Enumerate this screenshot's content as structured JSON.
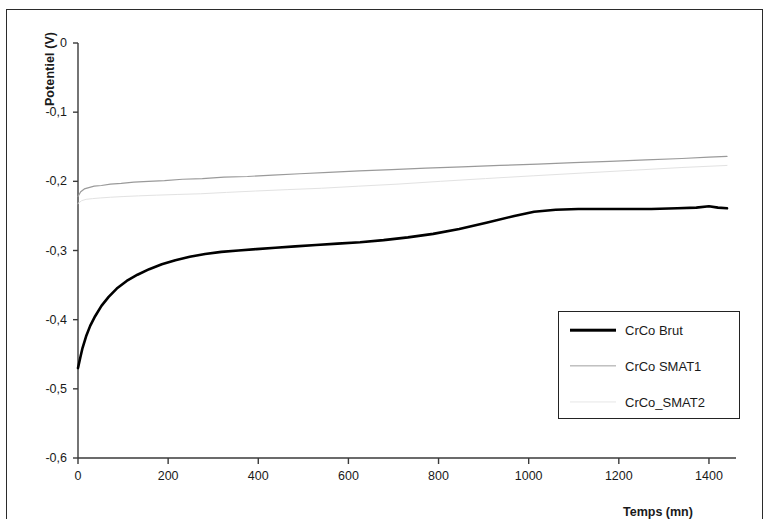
{
  "chart_data": {
    "type": "line",
    "title": "",
    "xlabel": "Temps (mn)",
    "ylabel": "Potentiel (V)",
    "xlim": [
      0,
      1460
    ],
    "ylim": [
      -0.6,
      0
    ],
    "xticks": [
      "0",
      "200",
      "400",
      "600",
      "800",
      "1000",
      "1200",
      "1400"
    ],
    "xtick_values": [
      0,
      200,
      400,
      600,
      800,
      1000,
      1200,
      1400
    ],
    "yticks": [
      "0",
      "-0,1",
      "-0,2",
      "-0,3",
      "-0,4",
      "-0,5",
      "-0,6"
    ],
    "ytick_values": [
      0,
      -0.1,
      -0.2,
      -0.3,
      -0.4,
      -0.5,
      -0.6
    ],
    "grid": false,
    "legend_position": "center-right",
    "decimal_separator": ",",
    "series": [
      {
        "name": "CrCo Brut",
        "color": "#000000",
        "width": 2.6,
        "x": [
          0,
          5,
          10,
          18,
          27,
          38,
          52,
          68,
          86,
          108,
          132,
          158,
          186,
          216,
          248,
          282,
          318,
          356,
          396,
          438,
          482,
          528,
          576,
          626,
          678,
          732,
          788,
          846,
          906,
          968,
          1012,
          1060,
          1110,
          1162,
          1216,
          1272,
          1330,
          1372,
          1400,
          1420,
          1440
        ],
        "y": [
          -0.47,
          -0.455,
          -0.441,
          -0.424,
          -0.409,
          -0.395,
          -0.38,
          -0.367,
          -0.355,
          -0.344,
          -0.335,
          -0.327,
          -0.32,
          -0.314,
          -0.309,
          -0.305,
          -0.302,
          -0.3,
          -0.298,
          -0.296,
          -0.294,
          -0.292,
          -0.29,
          -0.288,
          -0.285,
          -0.281,
          -0.276,
          -0.269,
          -0.26,
          -0.25,
          -0.244,
          -0.241,
          -0.24,
          -0.24,
          -0.24,
          -0.24,
          -0.239,
          -0.238,
          -0.236,
          -0.238,
          -0.239
        ]
      },
      {
        "name": "CrCo SMAT1",
        "color": "#9a9a9a",
        "width": 1.2,
        "x": [
          0,
          6,
          14,
          24,
          36,
          52,
          72,
          96,
          124,
          156,
          192,
          232,
          276,
          324,
          376,
          432,
          492,
          556,
          624,
          696,
          772,
          852,
          936,
          1020,
          1100,
          1180,
          1260,
          1340,
          1400,
          1440
        ],
        "y": [
          -0.222,
          -0.215,
          -0.211,
          -0.209,
          -0.207,
          -0.206,
          -0.204,
          -0.203,
          -0.201,
          -0.2,
          -0.199,
          -0.197,
          -0.196,
          -0.194,
          -0.193,
          -0.191,
          -0.189,
          -0.187,
          -0.185,
          -0.183,
          -0.181,
          -0.179,
          -0.177,
          -0.175,
          -0.173,
          -0.171,
          -0.169,
          -0.167,
          -0.165,
          -0.164
        ]
      },
      {
        "name": "CrCo_SMAT2",
        "color": "#e2e2e2",
        "width": 1.0,
        "x": [
          0,
          8,
          18,
          32,
          50,
          72,
          100,
          134,
          174,
          220,
          272,
          330,
          394,
          464,
          540,
          622,
          710,
          804,
          904,
          1010,
          1120,
          1230,
          1340,
          1440
        ],
        "y": [
          -0.232,
          -0.228,
          -0.226,
          -0.225,
          -0.224,
          -0.223,
          -0.222,
          -0.221,
          -0.22,
          -0.219,
          -0.218,
          -0.216,
          -0.214,
          -0.212,
          -0.21,
          -0.207,
          -0.204,
          -0.2,
          -0.196,
          -0.192,
          -0.188,
          -0.184,
          -0.18,
          -0.177
        ]
      }
    ]
  },
  "axes": {
    "ylabel": "Potentiel (V)",
    "xlabel": "Temps (mn)"
  },
  "legend": {
    "items": [
      {
        "label": "CrCo Brut",
        "color": "#000000",
        "thickness": "2.6px"
      },
      {
        "label": "CrCo SMAT1",
        "color": "#a0a0a0",
        "thickness": "1.3px"
      },
      {
        "label": "CrCo_SMAT2",
        "color": "#e6e6e6",
        "thickness": "1.1px"
      }
    ]
  }
}
